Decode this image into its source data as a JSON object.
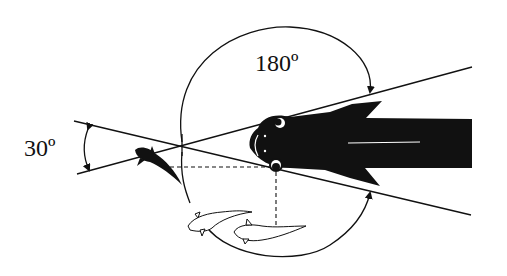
{
  "diagram": {
    "labels": {
      "angle_large": "180º",
      "angle_small": "30º"
    },
    "elements": [
      {
        "name": "large-fish",
        "description": "Black silhouette of large fish, head facing left, with two eyes and pectoral fins"
      },
      {
        "name": "small-fish-dark",
        "description": "Small black fish at the vertex of the 30º angle"
      },
      {
        "name": "small-fish-outline-1",
        "description": "Outlined small fish below-left"
      },
      {
        "name": "small-fish-outline-2",
        "description": "Outlined small fish below, under the eye"
      },
      {
        "name": "sight-lines",
        "description": "Two crossing straight lines through the fish eyes forming a 30º angle to the left"
      },
      {
        "name": "arc-180",
        "description": "Arc with arrowheads spanning 180º from upper sight line around the left to lower sight line"
      },
      {
        "name": "dashed-guides",
        "description": "Dashed horizontal and vertical guides from eye"
      }
    ],
    "colors": {
      "ink": "#111111",
      "background": "#ffffff"
    }
  }
}
